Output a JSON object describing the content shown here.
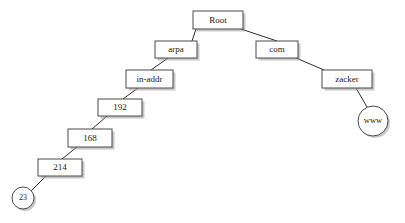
{
  "diagram": {
    "type": "tree",
    "background_color": "#ffffff",
    "node_fill_color": "#ffffff",
    "node_stroke_color": "#4a4a4a",
    "edge_color": "#2f2f2f",
    "label_color": "#1a1a1a",
    "shadow_color": "#9a9a9a",
    "nodes": [
      {
        "id": "root",
        "label": "Root",
        "shape": "rect",
        "x": 193,
        "y": 11,
        "w": 50,
        "h": 18
      },
      {
        "id": "arpa",
        "label": "arpa",
        "shape": "rect",
        "x": 155,
        "y": 41,
        "w": 42,
        "h": 17
      },
      {
        "id": "com",
        "label": "com",
        "shape": "rect",
        "x": 256,
        "y": 41,
        "w": 42,
        "h": 17
      },
      {
        "id": "in-addr",
        "label": "in-addr",
        "shape": "rect",
        "x": 126,
        "y": 70,
        "w": 47,
        "h": 18
      },
      {
        "id": "zacker",
        "label": "zacker",
        "shape": "rect",
        "x": 322,
        "y": 70,
        "w": 50,
        "h": 18
      },
      {
        "id": "n192",
        "label": "192",
        "shape": "rect",
        "x": 98,
        "y": 99,
        "w": 44,
        "h": 17
      },
      {
        "id": "www",
        "label": "www",
        "shape": "circle",
        "cx": 373,
        "cy": 121,
        "r": 15
      },
      {
        "id": "n168",
        "label": "168",
        "shape": "rect",
        "x": 68,
        "y": 129,
        "w": 44,
        "h": 18
      },
      {
        "id": "n214",
        "label": "214",
        "shape": "rect",
        "x": 38,
        "y": 159,
        "w": 44,
        "h": 17
      },
      {
        "id": "n23",
        "label": "23",
        "shape": "circle",
        "cx": 23,
        "cy": 198,
        "r": 11
      }
    ],
    "edges": [
      {
        "id": "root-arpa",
        "from": "root",
        "to": "arpa",
        "x1": 196,
        "y1": 29,
        "x2": 192,
        "y2": 41
      },
      {
        "id": "root-com",
        "from": "root",
        "to": "com",
        "x1": 241,
        "y1": 29,
        "x2": 277,
        "y2": 41
      },
      {
        "id": "arpa-inaddr",
        "from": "arpa",
        "to": "in-addr",
        "x1": 168,
        "y1": 58,
        "x2": 151,
        "y2": 70
      },
      {
        "id": "com-zacker",
        "from": "com",
        "to": "zacker",
        "x1": 296,
        "y1": 58,
        "x2": 324,
        "y2": 70
      },
      {
        "id": "inaddr-192",
        "from": "in-addr",
        "to": "n192",
        "x1": 138,
        "y1": 88,
        "x2": 123,
        "y2": 99
      },
      {
        "id": "zacker-www",
        "from": "zacker",
        "to": "www",
        "x1": 356,
        "y1": 88,
        "x2": 367,
        "y2": 107
      },
      {
        "id": "192-168",
        "from": "n192",
        "to": "n168",
        "x1": 107,
        "y1": 116,
        "x2": 92,
        "y2": 129
      },
      {
        "id": "168-214",
        "from": "n168",
        "to": "n214",
        "x1": 77,
        "y1": 147,
        "x2": 62,
        "y2": 159
      },
      {
        "id": "214-23",
        "from": "n214",
        "to": "n23",
        "x1": 46,
        "y1": 176,
        "x2": 31,
        "y2": 191
      }
    ]
  }
}
